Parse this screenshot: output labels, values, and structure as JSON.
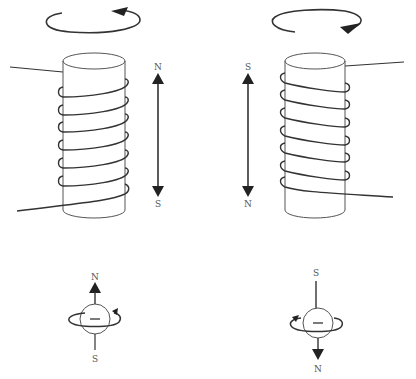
{
  "diagram": {
    "type": "electromagnet-and-electron-spin",
    "stroke_color": "#333333",
    "fill_color": "#222222",
    "left_panel": {
      "coil": {
        "turns": 7,
        "rotation_direction": "counterclockwise-viewed-from-top",
        "pole_top": "N",
        "pole_bottom": "S"
      },
      "electron": {
        "charge_symbol": "−",
        "pole_top": "N",
        "pole_bottom": "S",
        "moment_arrow": "up"
      }
    },
    "right_panel": {
      "coil": {
        "turns": 7,
        "rotation_direction": "clockwise-viewed-from-top",
        "pole_top": "S",
        "pole_bottom": "N"
      },
      "electron": {
        "charge_symbol": "−",
        "pole_top": "S",
        "pole_bottom": "N",
        "moment_arrow": "down"
      }
    }
  }
}
